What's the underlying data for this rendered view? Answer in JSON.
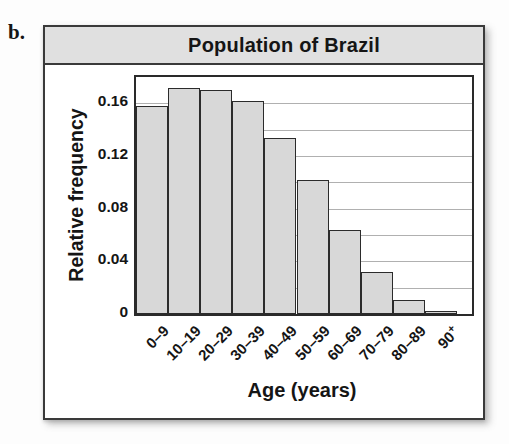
{
  "page": {
    "item_label": "b."
  },
  "colors": {
    "panel_border": "#3a3a3a",
    "title_bg": "#e0e0e0",
    "plot_border": "#2a2a2a",
    "bar_fill": "#d8d8d8",
    "bar_border": "#2b2b2b",
    "gridline": "#b0b0b0",
    "text": "#151515"
  },
  "chart_data": {
    "type": "bar",
    "title": "Population of Brazil",
    "xlabel": "Age (years)",
    "ylabel": "Relative frequency",
    "categories": [
      "0–9",
      "10–19",
      "20–29",
      "30–39",
      "40–49",
      "50–59",
      "60–69",
      "70–79",
      "80–89",
      "90+"
    ],
    "values": [
      0.158,
      0.172,
      0.17,
      0.162,
      0.134,
      0.102,
      0.064,
      0.032,
      0.011,
      0.002
    ],
    "ylim": [
      0,
      0.18
    ],
    "yticks": [
      {
        "v": 0,
        "label": "0"
      },
      {
        "v": 0.04,
        "label": "0.04"
      },
      {
        "v": 0.08,
        "label": "0.08"
      },
      {
        "v": 0.12,
        "label": "0.12"
      },
      {
        "v": 0.16,
        "label": "0.16"
      }
    ],
    "gridlines": [
      0.02,
      0.04,
      0.06,
      0.08,
      0.1,
      0.12,
      0.14,
      0.16
    ],
    "grid": true,
    "legend": false,
    "bar_gap": 0
  }
}
